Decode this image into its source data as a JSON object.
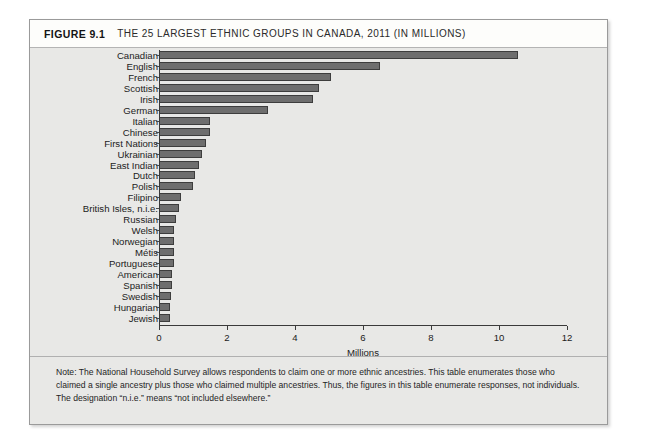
{
  "figure": {
    "label": "FIGURE 9.1",
    "title": "THE 25 LARGEST ETHNIC GROUPS IN CANADA, 2011 (IN MILLIONS)",
    "note": "Note: The National Household Survey allows respondents to claim one or more ethnic ancestries. This table enumerates those who claimed a single ancestry plus those who claimed multiple ancestries. Thus, the figures in this table enumerate responses, not individuals. The designation “n.i.e.” means “not included elsewhere.”"
  },
  "colors": {
    "bar_fill": "#6e6e6e",
    "bar_border": "#3d3d3d",
    "panel_bg": "#e8e8e6",
    "header_bg": "#fdfdfb",
    "axis": "#3a3a3a"
  },
  "chart_data": {
    "type": "bar",
    "orientation": "horizontal",
    "title": "THE 25 LARGEST ETHNIC GROUPS IN CANADA, 2011 (IN MILLIONS)",
    "xlabel": "Millions",
    "ylabel": "",
    "xlim": [
      0,
      12
    ],
    "xticks": [
      0,
      2,
      4,
      6,
      8,
      10,
      12
    ],
    "xtick_labels": [
      "0",
      "2",
      "4",
      "6",
      "8",
      "10",
      "12"
    ],
    "grid": false,
    "legend": false,
    "categories": [
      "Canadian",
      "English",
      "French",
      "Scottish",
      "Irish",
      "German",
      "Italian",
      "Chinese",
      "First Nations",
      "Ukrainian",
      "East Indian",
      "Dutch",
      "Polish",
      "Filipino",
      "British Isles, n.i.e.",
      "Russian",
      "Welsh",
      "Norwegian",
      "Métis",
      "Portuguese",
      "American",
      "Spanish",
      "Swedish",
      "Hungarian",
      "Jewish"
    ],
    "values": [
      10.56,
      6.51,
      5.07,
      4.71,
      4.54,
      3.2,
      1.49,
      1.49,
      1.37,
      1.25,
      1.17,
      1.07,
      1.01,
      0.66,
      0.58,
      0.5,
      0.45,
      0.45,
      0.45,
      0.43,
      0.37,
      0.37,
      0.34,
      0.32,
      0.31
    ]
  }
}
